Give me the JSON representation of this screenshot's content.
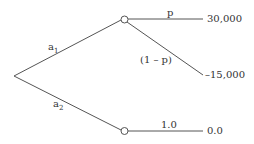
{
  "tree": {
    "decision_branches": [
      {
        "label": "a",
        "sub": "1"
      },
      {
        "label": "a",
        "sub": "2"
      }
    ],
    "chance_branches": {
      "upper_top": "p",
      "upper_bottom": "(1 – p)",
      "lower": "1.0"
    },
    "payoffs": {
      "upper_top": "30,000",
      "upper_bottom": "–15,000",
      "lower": "0.0"
    }
  }
}
